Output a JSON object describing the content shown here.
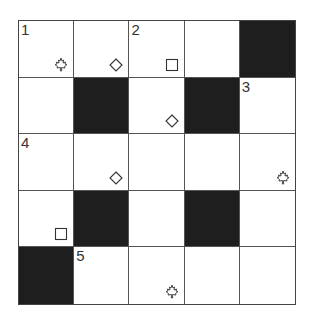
{
  "puzzle": {
    "rows": 5,
    "cols": 5,
    "cells": [
      [
        {
          "black": false,
          "number": "1",
          "mark": "maple-leaf"
        },
        {
          "black": false,
          "number": "",
          "mark": "diamond"
        },
        {
          "black": false,
          "number": "2",
          "mark": "square"
        },
        {
          "black": false,
          "number": "",
          "mark": ""
        },
        {
          "black": true,
          "number": "",
          "mark": ""
        }
      ],
      [
        {
          "black": false,
          "number": "",
          "mark": ""
        },
        {
          "black": true,
          "number": "",
          "mark": ""
        },
        {
          "black": false,
          "number": "",
          "mark": "diamond"
        },
        {
          "black": true,
          "number": "",
          "mark": ""
        },
        {
          "black": false,
          "number": "3",
          "mark": ""
        }
      ],
      [
        {
          "black": false,
          "number": "4",
          "mark": ""
        },
        {
          "black": false,
          "number": "",
          "mark": "diamond"
        },
        {
          "black": false,
          "number": "",
          "mark": ""
        },
        {
          "black": false,
          "number": "",
          "mark": ""
        },
        {
          "black": false,
          "number": "",
          "mark": "maple-leaf"
        }
      ],
      [
        {
          "black": false,
          "number": "",
          "mark": "square"
        },
        {
          "black": true,
          "number": "",
          "mark": ""
        },
        {
          "black": false,
          "number": "",
          "mark": ""
        },
        {
          "black": true,
          "number": "",
          "mark": ""
        },
        {
          "black": false,
          "number": "",
          "mark": ""
        }
      ],
      [
        {
          "black": true,
          "number": "",
          "mark": ""
        },
        {
          "black": false,
          "number": "5",
          "mark": ""
        },
        {
          "black": false,
          "number": "",
          "mark": "maple-leaf"
        },
        {
          "black": false,
          "number": "",
          "mark": ""
        },
        {
          "black": false,
          "number": "",
          "mark": ""
        }
      ]
    ]
  },
  "colors": {
    "black_cell": "#1e1e1e",
    "grid_line": "#555555",
    "mark": "#333333"
  }
}
